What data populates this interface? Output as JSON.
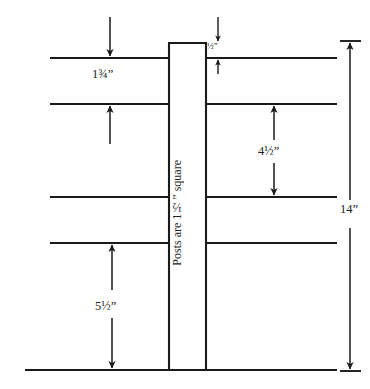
{
  "diagram": {
    "post_note": "Posts are 1½” square",
    "stroke_color": "#1a1a1a",
    "background_color": "#ffffff"
  },
  "dimensions": {
    "top_rail_gap": {
      "label": "1¾”",
      "meaning": "gap above first rail",
      "arrow": "down"
    },
    "post_top_offset": {
      "label": "½”",
      "meaning": "post extends above top rail",
      "arrow": "double"
    },
    "middle_gap": {
      "label": "4½”",
      "meaning": "spacing between second and third rail",
      "arrow": "double"
    },
    "bottom_gap": {
      "label": "5½”",
      "meaning": "spacing between bottom rail and ground",
      "arrow": "double"
    },
    "overall_height": {
      "label": "14”",
      "meaning": "total height from top rail to ground",
      "arrow": "double"
    }
  },
  "geometry": {
    "post": {
      "x": 169,
      "y": 43,
      "width": 37,
      "height": 327
    },
    "rails_y": [
      58,
      104,
      197,
      243
    ],
    "rail_left_x": 50,
    "rail_right_x": 337,
    "ground_y": 370,
    "ground_left_x": 25,
    "ground_right_x": 337,
    "overall_dim_x": 350
  }
}
